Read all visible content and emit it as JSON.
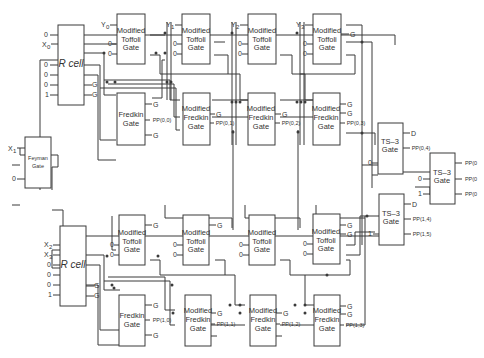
{
  "diagram": {
    "gates": {
      "feyman": {
        "line1": "Feyman",
        "line2": "Gate"
      },
      "rcell_top": {
        "label": "R cell"
      },
      "rcell_bottom": {
        "label": "R cell"
      },
      "mt": {
        "line1": "Modified",
        "line2": "Toffoli",
        "line3": "Gate"
      },
      "fr": {
        "line1": "Fredkin",
        "line2": "Gate"
      },
      "mf": {
        "line1": "Modified",
        "line2": "Fredkin",
        "line3": "Gate"
      },
      "ts3": {
        "line1": "TS–3",
        "line2": "Gate"
      }
    },
    "inputs": {
      "x0": "X",
      "x0_sub": "0",
      "x1": "X",
      "x1_sub": "1",
      "x2": "X",
      "x2_sub": "2",
      "x3": "X",
      "x3_sub": "3",
      "y0": "Y",
      "y0_sub": "0",
      "y1": "Y",
      "y1_sub": "1",
      "y2": "Y",
      "y2_sub": "2",
      "y3": "Y",
      "y3_sub": "3",
      "zero": "0",
      "one": "1"
    },
    "outputs": {
      "garbage": "G",
      "d": "D",
      "pp00": "PP(0,0)",
      "pp01": "PP(0,1)",
      "pp02": "PP(0,2)",
      "pp03": "PP(0,3)",
      "pp04": "PP(0,4)",
      "pp10": "PP(1,0)",
      "pp11": "PP(1,1)",
      "pp12": "PP(1,2)",
      "pp13": "PP(1,3)",
      "pp14": "PP(1,4)",
      "pp15": "PP(1,5)",
      "ppf1": "PP(0",
      "ppf2": "PP(0",
      "ppf3": "PP(0"
    }
  }
}
